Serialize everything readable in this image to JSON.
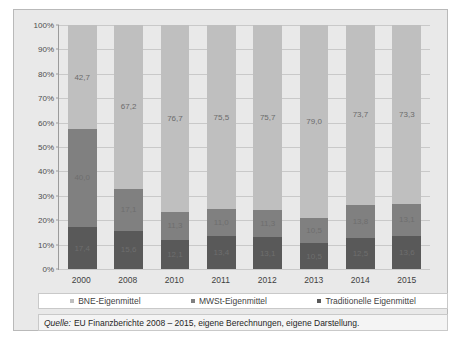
{
  "title_strip": "",
  "chart_data": {
    "type": "bar",
    "title": "",
    "subtitle": "",
    "xlabel": "",
    "ylabel": "",
    "ylim": [
      0,
      100
    ],
    "ytick_labels": [
      "0%",
      "10%",
      "20%",
      "30%",
      "40%",
      "50%",
      "60%",
      "70%",
      "80%",
      "90%",
      "100%"
    ],
    "ytick_values": [
      0,
      10,
      20,
      30,
      40,
      50,
      60,
      70,
      80,
      90,
      100
    ],
    "grid": true,
    "stacked": true,
    "legend_position": "bottom",
    "categories": [
      "2000",
      "2008",
      "2010",
      "2011",
      "2012",
      "2013",
      "2014",
      "2015"
    ],
    "series": [
      {
        "name": "BNE-Eigenmittel",
        "color": "#bfbfbf",
        "values": [
          42.7,
          67.2,
          76.7,
          75.5,
          75.7,
          79.0,
          73.7,
          73.3
        ],
        "labels": [
          "42,7",
          "67,2",
          "76,7",
          "75,5",
          "75,7",
          "79,0",
          "73,7",
          "73,3"
        ]
      },
      {
        "name": "MWSt-Eigenmittel",
        "color": "#808080",
        "values": [
          40.0,
          17.1,
          11.3,
          11.0,
          11.3,
          10.5,
          13.8,
          13.1
        ],
        "labels": [
          "40,0",
          "17,1",
          "11,3",
          "11,0",
          "11,3",
          "10,5",
          "13,8",
          "13,1"
        ]
      },
      {
        "name": "Traditionelle Eigenmittel",
        "color": "#595959",
        "values": [
          17.4,
          15.6,
          12.1,
          13.4,
          13.1,
          10.5,
          12.5,
          13.6
        ],
        "labels": [
          "17,4",
          "15,6",
          "12,1",
          "13,4",
          "13,1",
          "10,5",
          "12,5",
          "13,6"
        ]
      }
    ]
  },
  "source": {
    "prefix": "Quelle:",
    "text": "EU Finanzberichte 2008 – 2015, eigene Berechnungen, eigene Darstellung."
  }
}
